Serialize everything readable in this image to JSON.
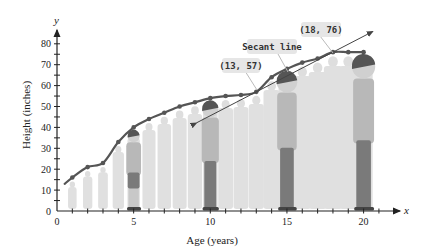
{
  "chart_data": {
    "type": "line",
    "title": "",
    "xlabel": "Age (years)",
    "ylabel": "Height (inches)",
    "x_axis_var": "x",
    "y_axis_var": "y",
    "xlim": [
      0,
      22
    ],
    "ylim": [
      0,
      85
    ],
    "x_ticks": [
      0,
      5,
      10,
      15,
      20
    ],
    "y_ticks": [
      0,
      10,
      20,
      30,
      40,
      50,
      60,
      70,
      80
    ],
    "grid": false,
    "series": [
      {
        "name": "Height",
        "x": [
          1,
          2,
          3,
          4,
          5,
          6,
          7,
          8,
          9,
          10,
          11,
          12,
          13,
          14,
          15,
          16,
          17,
          18,
          19,
          20
        ],
        "values": [
          16,
          21,
          23,
          33,
          40,
          44,
          47,
          50,
          52,
          54,
          55,
          55.5,
          57,
          64,
          68,
          71,
          73,
          76,
          76,
          76
        ]
      }
    ],
    "secant_line": {
      "label": "Secant line",
      "points": [
        [
          13,
          57
        ],
        [
          18,
          76
        ]
      ],
      "x_range": [
        9.1,
        20.6
      ]
    },
    "annotations": [
      {
        "text": "(13, 57)",
        "x": 13,
        "y": 57
      },
      {
        "text": "Secant line"
      },
      {
        "text": "(18, 76)",
        "x": 18,
        "y": 76
      }
    ]
  },
  "labels": {
    "xlabel": "Age (years)",
    "ylabel": "Height (inches)",
    "x_var": "x",
    "y_var": "y",
    "callout_1": "(13, 57)",
    "callout_2": "Secant line",
    "callout_3": "(18, 76)",
    "x_tick_0": "0",
    "x_tick_5": "5",
    "x_tick_10": "10",
    "x_tick_15": "15",
    "x_tick_20": "20",
    "y_tick_0": "0",
    "y_tick_10": "10",
    "y_tick_20": "20",
    "y_tick_30": "30",
    "y_tick_40": "40",
    "y_tick_50": "50",
    "y_tick_60": "60",
    "y_tick_70": "70",
    "y_tick_80": "80"
  },
  "colors": {
    "curve": "#555555",
    "axis": "#222222",
    "silhouette": "#dcdcdc",
    "figure": "#8a8a8a",
    "callout_bg": "#e6e6e6"
  }
}
